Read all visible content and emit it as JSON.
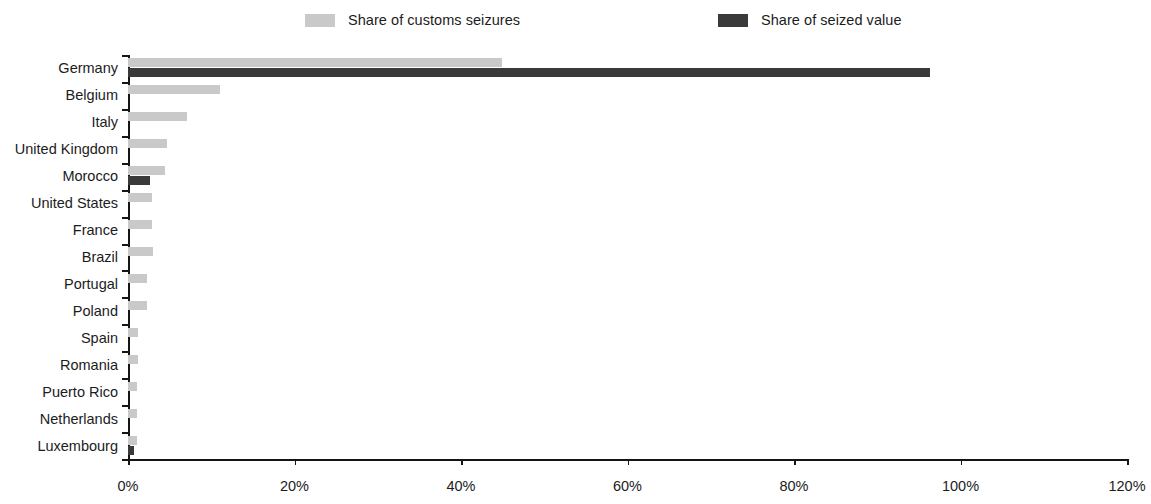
{
  "chart_data": {
    "type": "bar",
    "orientation": "horizontal",
    "title": "",
    "subtitle": "",
    "xlabel": "",
    "ylabel": "",
    "xlim": [
      0,
      120
    ],
    "xticks": [
      0,
      20,
      40,
      60,
      80,
      100,
      120
    ],
    "xtick_labels": [
      "0%",
      "20%",
      "40%",
      "60%",
      "80%",
      "100%",
      "120%"
    ],
    "grid": false,
    "legend_position": "top",
    "categories": [
      "Germany",
      "Belgium",
      "Italy",
      "United Kingdom",
      "Morocco",
      "United States",
      "France",
      "Brazil",
      "Portugal",
      "Poland",
      "Spain",
      "Romania",
      "Puerto Rico",
      "Netherlands",
      "Luxembourg"
    ],
    "series": [
      {
        "name": "Share of customs seizures",
        "color": "#c9c9c9",
        "values": [
          44.9,
          11.0,
          7.1,
          4.7,
          4.4,
          2.9,
          2.9,
          3.0,
          2.3,
          2.3,
          1.2,
          1.2,
          1.1,
          1.1,
          1.1
        ]
      },
      {
        "name": "Share of seized value",
        "color": "#3a3a3a",
        "values": [
          96.3,
          0.0,
          0.0,
          0.0,
          2.6,
          0.0,
          0.0,
          0.0,
          0.0,
          0.0,
          0.0,
          0.0,
          0.0,
          0.0,
          0.7
        ]
      }
    ]
  },
  "legend": {
    "items": [
      {
        "label": "Share of customs seizures",
        "color": "#c9c9c9"
      },
      {
        "label": "Share of seized value",
        "color": "#3a3a3a"
      }
    ]
  },
  "colors": {
    "light_bar": "#c9c9c9",
    "dark_bar": "#3a3a3a",
    "axis": "#151515",
    "text": "#1c1c1c",
    "background": "#ffffff"
  }
}
